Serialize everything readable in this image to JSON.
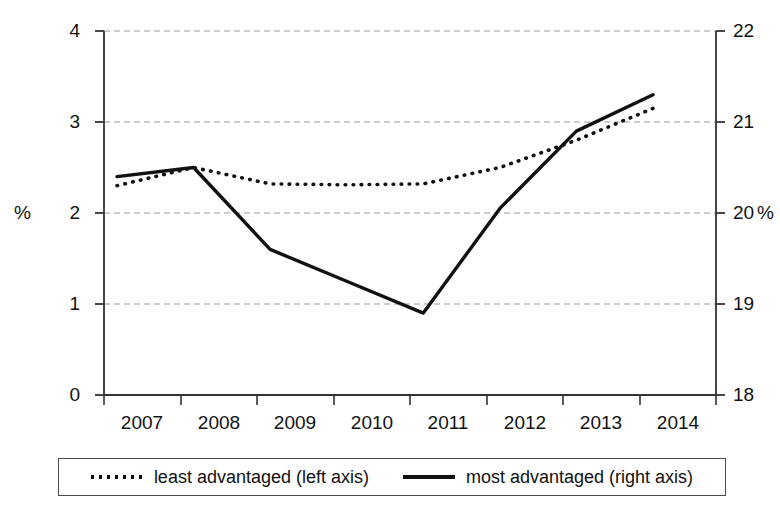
{
  "chart_data": {
    "type": "line",
    "title": "",
    "subtitle": "",
    "xlabel": "",
    "ylabel": "%",
    "y2label": "%",
    "categories": [
      "2007",
      "2008",
      "2009",
      "2010",
      "2011",
      "2012",
      "2013",
      "2014"
    ],
    "ylim": [
      0,
      4
    ],
    "yticks": [
      0,
      1,
      2,
      3,
      4
    ],
    "y2lim": [
      18,
      22
    ],
    "y2ticks": [
      18,
      19,
      20,
      21,
      22
    ],
    "grid": true,
    "grid_style": "dashed-horizontal",
    "legend_position": "bottom",
    "series": [
      {
        "name": "least advantaged (left axis)",
        "axis": "left",
        "style": "dotted",
        "color": "#111111",
        "values": [
          2.3,
          2.5,
          2.32,
          2.31,
          2.32,
          2.5,
          2.8,
          3.15
        ]
      },
      {
        "name": "most advantaged  (right axis)",
        "axis": "right",
        "style": "solid",
        "color": "#111111",
        "values": [
          20.4,
          20.5,
          19.6,
          19.25,
          18.9,
          20.05,
          20.9,
          21.3
        ]
      }
    ]
  },
  "axes": {
    "left": {
      "unit_label": "%",
      "tick_labels": [
        "0",
        "1",
        "2",
        "3",
        "4"
      ]
    },
    "right": {
      "unit_label": "%",
      "tick_labels": [
        "18",
        "19",
        "20",
        "21",
        "22"
      ]
    },
    "x": {
      "tick_labels": [
        "2007",
        "2008",
        "2009",
        "2010",
        "2011",
        "2012",
        "2013",
        "2014"
      ]
    }
  },
  "legend": {
    "entries": [
      {
        "label": "least advantaged (left axis)",
        "style": "dotted"
      },
      {
        "label": "most advantaged  (right axis)",
        "style": "solid"
      }
    ]
  }
}
